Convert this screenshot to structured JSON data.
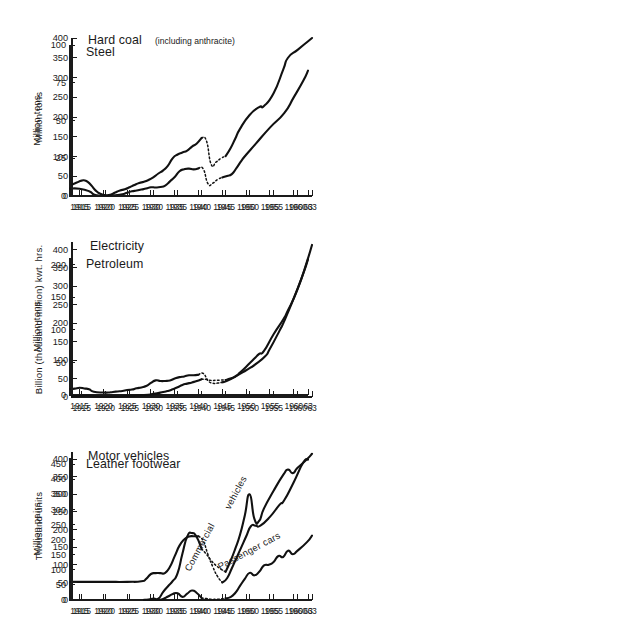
{
  "figure": {
    "title": "",
    "panel_layout": "3 rows x 2 columns",
    "background": "#ffffff",
    "line_color": "#111111"
  },
  "chart_data": [
    {
      "id": "steel",
      "type": "line",
      "title": "Steel",
      "title_sub": "",
      "xlabel": "",
      "ylabel": "Million tons",
      "xlim": [
        1913,
        1963
      ],
      "ylim": [
        0,
        100
      ],
      "yticks": [
        0,
        25,
        50,
        75,
        100
      ],
      "xticks": [
        1915,
        1920,
        1925,
        1930,
        1935,
        1940,
        1945,
        1950,
        1955,
        1960,
        1963
      ],
      "xticklabels": [
        "1915",
        "1920",
        "1925",
        "1930",
        "1935",
        "1940",
        "1945",
        "1950",
        "1955",
        "1960",
        "63"
      ],
      "grid": false,
      "legend": "none",
      "series": [
        {
          "name": "Steel output",
          "style": "solid",
          "x": [
            1913,
            1915,
            1917,
            1918,
            1919,
            1920,
            1921,
            1922,
            1923,
            1924,
            1925,
            1926,
            1927,
            1928,
            1929,
            1930,
            1931,
            1932,
            1933,
            1934,
            1935,
            1936,
            1937,
            1938,
            1939,
            1940
          ],
          "y": [
            4.9,
            4.8,
            3.2,
            1.0,
            0.3,
            0.2,
            0.2,
            0.4,
            0.7,
            1.1,
            2.1,
            3.1,
            3.6,
            4.3,
            4.9,
            5.8,
            5.6,
            5.9,
            6.9,
            9.7,
            12.6,
            16.4,
            17.7,
            18.1,
            17.6,
            18.3
          ]
        },
        {
          "name": "War-years gap",
          "style": "dotted",
          "x": [
            1940,
            1941,
            1942,
            1943,
            1944,
            1945
          ],
          "y": [
            18.3,
            17.9,
            8.1,
            8.5,
            10.9,
            12.3
          ]
        },
        {
          "name": "Post-war output",
          "style": "solid",
          "x": [
            1945,
            1946,
            1947,
            1948,
            1949,
            1950,
            1952,
            1955,
            1958,
            1960,
            1962,
            1963
          ],
          "y": [
            12.3,
            13.3,
            14.5,
            18.6,
            23.3,
            27.3,
            34.5,
            45.3,
            54.9,
            65.3,
            76.3,
            83.0
          ]
        }
      ]
    },
    {
      "id": "hard-coal",
      "type": "line",
      "title": "Hard coal",
      "title_sub": "(including anthracite)",
      "xlabel": "",
      "ylabel": "Million tons",
      "xlim": [
        1913,
        1963
      ],
      "ylim": [
        0,
        400
      ],
      "yticks": [
        0,
        50,
        100,
        150,
        200,
        250,
        300,
        350,
        400
      ],
      "xticks": [
        1915,
        1920,
        1925,
        1930,
        1935,
        1940,
        1945,
        1950,
        1955,
        1960,
        1963
      ],
      "xticklabels": [
        "1915",
        "1920",
        "1925",
        "1930",
        "1935",
        "1940",
        "1945",
        "1950",
        "1955",
        "1960",
        "63"
      ],
      "grid": false,
      "legend": "none",
      "series": [
        {
          "name": "Hard coal output",
          "style": "solid",
          "x": [
            1913,
            1914,
            1915,
            1916,
            1917,
            1918,
            1919,
            1920,
            1921,
            1922,
            1923,
            1924,
            1925,
            1926,
            1927,
            1928,
            1929,
            1930,
            1931,
            1932,
            1933,
            1934,
            1935,
            1936,
            1937,
            1938,
            1939,
            1940
          ],
          "y": [
            29,
            34,
            39,
            38,
            27,
            13,
            5,
            2,
            3,
            9,
            14,
            17,
            22,
            28,
            33,
            36,
            41,
            48,
            57,
            65,
            77,
            96,
            105,
            110,
            115,
            125,
            133,
            147
          ]
        },
        {
          "name": "War-years gap",
          "style": "dotted",
          "x": [
            1940,
            1941,
            1942,
            1943,
            1944,
            1945
          ],
          "y": [
            147,
            140,
            80,
            86,
            95,
            101
          ]
        },
        {
          "name": "Post-war output",
          "style": "solid",
          "x": [
            1945,
            1946,
            1947,
            1948,
            1950,
            1952,
            1953,
            1955,
            1957,
            1958,
            1960,
            1962,
            1963
          ],
          "y": [
            101,
            120,
            145,
            170,
            205,
            225,
            228,
            260,
            320,
            350,
            370,
            390,
            400
          ]
        }
      ]
    },
    {
      "id": "petroleum",
      "type": "line",
      "title": "Petroleum",
      "title_sub": "",
      "xlabel": "",
      "ylabel": "Million tons",
      "xlim": [
        1913,
        1963
      ],
      "ylim": [
        0,
        210
      ],
      "yticks": [
        0,
        50,
        100,
        150,
        200
      ],
      "xticks": [
        1915,
        1920,
        1925,
        1930,
        1935,
        1940,
        1945,
        1950,
        1955,
        1960,
        1963
      ],
      "xticklabels": [
        "1915",
        "1920",
        "1925",
        "1930",
        "1935",
        "1940",
        "1945",
        "1950",
        "1955",
        "1960",
        "63"
      ],
      "grid": false,
      "legend": "none",
      "series": [
        {
          "name": "Petroleum output",
          "style": "solid",
          "x": [
            1913,
            1914,
            1915,
            1916,
            1917,
            1918,
            1920,
            1921,
            1922,
            1923,
            1924,
            1925,
            1926,
            1927,
            1928,
            1929,
            1930,
            1931,
            1932,
            1933,
            1934,
            1935,
            1936,
            1937,
            1938,
            1939,
            1940
          ],
          "y": [
            9.2,
            9.8,
            11.0,
            10.0,
            8.8,
            5.0,
            3.8,
            3.8,
            4.7,
            5.4,
            6.1,
            7.6,
            8.3,
            10.3,
            11.6,
            13.7,
            18.5,
            22.4,
            21.4,
            21.5,
            22.3,
            25.2,
            27.4,
            28.5,
            30.2,
            30.3,
            31.1
          ]
        },
        {
          "name": "War-years gap",
          "style": "dotted",
          "x": [
            1940,
            1941,
            1942,
            1943,
            1944,
            1945
          ],
          "y": [
            31.1,
            33.0,
            22.0,
            18.0,
            18.3,
            19.4
          ]
        },
        {
          "name": "Post-war output",
          "style": "solid",
          "x": [
            1945,
            1946,
            1948,
            1950,
            1951,
            1952,
            1954,
            1955,
            1957,
            1958,
            1960,
            1962,
            1963
          ],
          "y": [
            19.4,
            21.7,
            29.2,
            37.9,
            42.3,
            47.3,
            59.3,
            70.8,
            98.3,
            113.2,
            148.0,
            186.0,
            208.0
          ]
        }
      ]
    },
    {
      "id": "electricity",
      "type": "line",
      "title": "Electricity",
      "title_sub": "",
      "xlabel": "",
      "ylabel": "Billion (thousand million) kwt. hrs.",
      "xlim": [
        1913,
        1963
      ],
      "ylim": [
        0,
        420
      ],
      "yticks": [
        0,
        50,
        100,
        150,
        200,
        250,
        300,
        350,
        400
      ],
      "xticks": [
        1915,
        1920,
        1925,
        1930,
        1935,
        1940,
        1945,
        1950,
        1955,
        1960,
        1963
      ],
      "xticklabels": [
        "1915",
        "1920",
        "1925",
        "1930",
        "1935",
        "1940",
        "1945",
        "1950",
        "1955",
        "1960",
        "63"
      ],
      "grid": false,
      "legend": "none",
      "series": [
        {
          "name": "Electricity output",
          "style": "solid",
          "x": [
            1913,
            1914,
            1915,
            1916,
            1917,
            1918,
            1920,
            1922,
            1925,
            1928,
            1930,
            1932,
            1933,
            1934,
            1935,
            1936,
            1937,
            1938,
            1939,
            1940
          ],
          "y": [
            2.0,
            2.5,
            3.5,
            4.0,
            3.0,
            1.5,
            0.5,
            1.1,
            2.9,
            5.0,
            8.4,
            13.5,
            16.4,
            21.0,
            26.3,
            32.8,
            36.2,
            39.6,
            43.2,
            48.3
          ]
        },
        {
          "name": "War-years gap",
          "style": "dotted",
          "x": [
            1940,
            1941,
            1942,
            1943,
            1944,
            1945
          ],
          "y": [
            48.3,
            47.5,
            45.0,
            45.2,
            45.7,
            46.0
          ]
        },
        {
          "name": "Post-war output",
          "style": "solid",
          "x": [
            1945,
            1946,
            1947,
            1948,
            1950,
            1951,
            1952,
            1953,
            1955,
            1957,
            1958,
            1960,
            1962,
            1963
          ],
          "y": [
            46.0,
            50.0,
            56.0,
            66.0,
            91.2,
            104.0,
            117.0,
            125.0,
            170.2,
            210.0,
            235.0,
            292.0,
            369.0,
            412.0
          ]
        }
      ]
    },
    {
      "id": "leather-footwear",
      "type": "line",
      "title": "Leather footwear",
      "title_sub": "",
      "xlabel": "",
      "ylabel": "Million pairs",
      "xlim": [
        1913,
        1963
      ],
      "ylim": [
        0,
        470
      ],
      "yticks": [
        0,
        50,
        100,
        150,
        200,
        250,
        300,
        350,
        400,
        450
      ],
      "xticks": [
        1915,
        1920,
        1925,
        1930,
        1935,
        1940,
        1945,
        1950,
        1955,
        1960,
        1963
      ],
      "xticklabels": [
        "1915",
        "1920",
        "1925",
        "1930",
        "1935",
        "1940",
        "1945",
        "1950",
        "1955",
        "1960",
        "63"
      ],
      "grid": false,
      "legend": "none",
      "series": [
        {
          "name": "Leather footwear output",
          "style": "solid",
          "x": [
            1913,
            1920,
            1925,
            1928,
            1929,
            1930,
            1931,
            1932,
            1933,
            1934,
            1935,
            1936,
            1937,
            1938,
            1939,
            1940
          ],
          "y": [
            60,
            60,
            60,
            62,
            70,
            86,
            89,
            89,
            90,
            110,
            145,
            180,
            200,
            210,
            211,
            211
          ]
        },
        {
          "name": "War-years gap",
          "style": "dotted",
          "x": [
            1940,
            1941,
            1942,
            1943,
            1944,
            1945
          ],
          "y": [
            211,
            195,
            150,
            110,
            78,
            58
          ]
        },
        {
          "name": "Post-war output",
          "style": "solid",
          "x": [
            1945,
            1946,
            1947,
            1948,
            1949,
            1950,
            1951,
            1952,
            1953,
            1955,
            1957,
            1958,
            1960,
            1962,
            1963
          ],
          "y": [
            58,
            72,
            105,
            140,
            175,
            210,
            244,
            246,
            246,
            275,
            315,
            330,
            390,
            455,
            465
          ]
        }
      ]
    },
    {
      "id": "motor-vehicles",
      "type": "line",
      "title": "Motor vehicles",
      "title_sub": "",
      "xlabel": "",
      "ylabel": "Thousand units",
      "xlim": [
        1913,
        1963
      ],
      "ylim": [
        0,
        420
      ],
      "yticks": [
        0,
        50,
        100,
        150,
        200,
        250,
        300,
        350,
        400
      ],
      "xticks": [
        1915,
        1920,
        1925,
        1930,
        1935,
        1940,
        1945,
        1950,
        1955,
        1960,
        1963
      ],
      "xticklabels": [
        "1915",
        "1920",
        "1925",
        "1930",
        "1935",
        "1940",
        "1945",
        "1950",
        "1955",
        "1960",
        "63"
      ],
      "grid": false,
      "legend": "inline-labels",
      "annotations": [
        {
          "text": "Commercial vehicles",
          "for": "commercial-vehicles"
        },
        {
          "text": "Passenger cars",
          "for": "passenger-cars"
        }
      ],
      "series": [
        {
          "name": "Commercial vehicles",
          "style": "solid",
          "x": [
            1928,
            1929,
            1930,
            1931,
            1932,
            1933,
            1934,
            1935,
            1936,
            1937,
            1938,
            1939,
            1940
          ],
          "y": [
            0.8,
            1.5,
            4.0,
            3.9,
            23.0,
            39.0,
            54.0,
            76.0,
            131.0,
            180.0,
            190.0,
            178.0,
            145.0
          ]
        },
        {
          "name": "Commercial vehicles war gap",
          "style": "dotted",
          "x": [
            1940,
            1941,
            1942,
            1943,
            1944,
            1945
          ],
          "y": [
            145.0,
            130.0,
            112.0,
            98.0,
            88.0,
            80.0
          ]
        },
        {
          "name": "Commercial vehicles post-war",
          "style": "solid",
          "x": [
            1945,
            1946,
            1947,
            1948,
            1949,
            1950,
            1951,
            1952,
            1953,
            1955,
            1957,
            1958,
            1959,
            1960,
            1962,
            1963
          ],
          "y": [
            80.0,
            110.0,
            145.0,
            185.0,
            240.0,
            300.0,
            230.0,
            225.0,
            260.0,
            310.0,
            355.0,
            370.0,
            360.0,
            375.0,
            400.0,
            415.0
          ]
        },
        {
          "name": "Passenger cars",
          "style": "solid",
          "x": [
            1928,
            1930,
            1931,
            1932,
            1933,
            1934,
            1935,
            1936,
            1937,
            1938,
            1939,
            1940
          ],
          "y": [
            0.1,
            0.5,
            0.6,
            3.0,
            10.0,
            17.0,
            19.0,
            9.0,
            18.0,
            27.0,
            20.0,
            5.5
          ]
        },
        {
          "name": "Passenger cars war gap",
          "style": "dotted",
          "x": [
            1940,
            1941,
            1942,
            1943,
            1944,
            1945
          ],
          "y": [
            5.5,
            4.0,
            2.0,
            2.0,
            3.0,
            4.8
          ]
        },
        {
          "name": "Passenger cars post-war",
          "style": "solid",
          "x": [
            1945,
            1946,
            1947,
            1948,
            1949,
            1950,
            1951,
            1952,
            1953,
            1954,
            1955,
            1956,
            1957,
            1958,
            1959,
            1960,
            1962,
            1963
          ],
          "y": [
            4.8,
            8.0,
            20.0,
            40.0,
            60.0,
            77.0,
            70.0,
            80.0,
            98.0,
            100.0,
            108.0,
            125.0,
            122.0,
            140.0,
            130.0,
            140.0,
            165.0,
            183.0
          ]
        }
      ]
    }
  ]
}
